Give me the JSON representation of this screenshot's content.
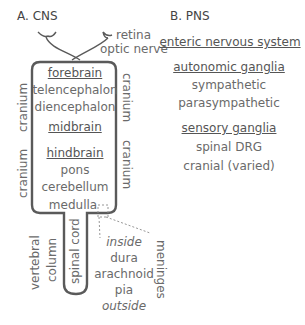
{
  "cns": {
    "title": "A. CNS",
    "labels": {
      "retina": "retina",
      "optic_nerve": "optic nerve",
      "forebrain": "forebrain",
      "telencephalon": "telencephalon",
      "diencephalon": "diencephalon",
      "midbrain": "midbrain",
      "hindbrain": "hindbrain",
      "pons": "pons",
      "cerebellum": "cerebellum",
      "medulla": "medulla",
      "spinal_cord": "spinal cord",
      "vertebral": "vertebral",
      "column": "column",
      "cranium_left_top": "cranium",
      "cranium_left_bottom": "cranium",
      "cranium_right_top": "cranium",
      "cranium_right_bottom": "cranium",
      "meninges": "meninges",
      "inside": "inside",
      "dura": "dura",
      "arachnoid": "arachnoid",
      "pia": "pia",
      "outside": "outside"
    }
  },
  "pns": {
    "title": "B. PNS",
    "enteric": "enteric nervous system",
    "autonomic": "autonomic ganglia",
    "sympathetic": "sympathetic",
    "parasympathetic": "parasympathetic",
    "sensory": "sensory ganglia",
    "spinal_drg": "spinal DRG",
    "cranial": "cranial (varied)"
  },
  "colors": {
    "outline": "#5a5a5a",
    "text": "#6a6a6a",
    "dashed": "#8a8a8a"
  }
}
